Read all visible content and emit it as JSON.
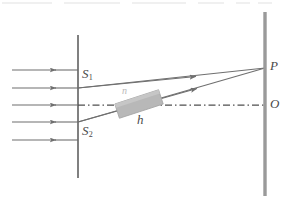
{
  "figure": {
    "width": 286,
    "height": 203,
    "background": "#ffffff"
  },
  "colors": {
    "line": "#6f6f6f",
    "barrier": "#6a6a6a",
    "screen": "#9a9a9a",
    "glass_fill": "#b8b8b8",
    "glass_stroke": "#a5a5a5",
    "label": "#4a4a4a",
    "faint": "#b9b9b9"
  },
  "labels": {
    "slit_top": "S",
    "slit_top_sub": "1",
    "slit_bottom": "S",
    "slit_bottom_sub": "2",
    "point_p": "P",
    "point_o": "O",
    "thickness": "h",
    "refractive_index": "n"
  },
  "geometry": {
    "barrier": {
      "x": 78,
      "y_top": 35,
      "y_bottom": 178
    },
    "screen": {
      "x": 265,
      "y_top": 12,
      "y_bottom": 196
    },
    "optical_axis_y": 105,
    "slit_top_y": 88,
    "slit_bottom_y": 122,
    "point_p": {
      "x": 265,
      "y": 68
    },
    "point_o": {
      "x": 265,
      "y": 105
    },
    "incoming_rays_y": [
      70,
      88,
      105,
      122,
      140
    ],
    "incoming_ray_x_start": 12,
    "incoming_ray_x_end": 78,
    "glass_block": {
      "center_x": 139,
      "center_y": 104,
      "length": 46,
      "thickness": 15,
      "tilt_deg": -18
    }
  },
  "elements": {
    "barrier_name": "slit-barrier",
    "screen_name": "observation-screen",
    "axis_name": "optical-axis",
    "glass_name": "glass-plate",
    "ray_top_name": "ray-from-s1-to-p",
    "ray_bottom_name": "ray-from-s2-to-p"
  }
}
